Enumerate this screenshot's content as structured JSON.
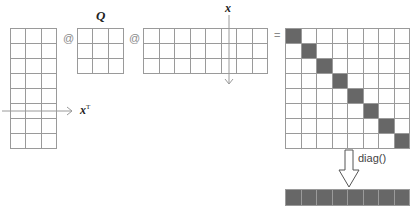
{
  "diagram": {
    "colors": {
      "grid_line": "#9a9a9a",
      "filled": "#676767",
      "arrow": "#9a9a9a",
      "text": "#222222"
    },
    "operators": {
      "matmul_1": "@",
      "matmul_2": "@",
      "equals": "="
    },
    "labels": {
      "q": "Q",
      "x": "x",
      "xt_base": "x",
      "xt_sup": "T",
      "diag": "diag()"
    },
    "matrices": {
      "left": {
        "name": "X",
        "rows": 8,
        "cols": 3
      },
      "q": {
        "name": "Q",
        "rows": 3,
        "cols": 3
      },
      "middle": {
        "name": "X^T",
        "rows": 3,
        "cols": 8,
        "highlight_col": 6
      },
      "result": {
        "name": "result",
        "rows": 8,
        "cols": 8,
        "filled": "diagonal"
      },
      "vector": {
        "name": "diag-vector",
        "rows": 1,
        "cols": 8,
        "filled": "all"
      }
    }
  }
}
